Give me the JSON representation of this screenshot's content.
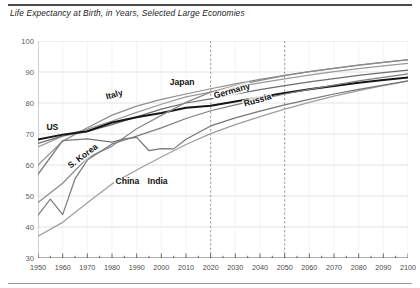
{
  "chart_data": {
    "type": "line",
    "title": "Life Expectancy at Birth, in Years, Selected Large Economies",
    "xlabel": "",
    "ylabel": "",
    "xlim": [
      1950,
      2100
    ],
    "ylim": [
      30,
      100
    ],
    "ytick_step": 10,
    "xtick_step": 10,
    "grid": true,
    "legend": "inline-labels",
    "xticks": [
      "1950",
      "1960",
      "1970",
      "1980",
      "1990",
      "2000",
      "2010",
      "2020",
      "2030",
      "2040",
      "2050",
      "2060",
      "2070",
      "2080",
      "2090",
      "2100"
    ],
    "yticks": [
      "30",
      "40",
      "50",
      "60",
      "70",
      "80",
      "90",
      "100"
    ],
    "annotations": [
      {
        "name": "projection-start-line",
        "type": "vline",
        "x": 2020,
        "style": "dashed"
      },
      {
        "name": "midcentury-line",
        "type": "vline",
        "x": 2050,
        "style": "dashed"
      }
    ],
    "series": [
      {
        "name": "Japan",
        "color": "#8e8e8e",
        "width": 1.25,
        "label_x": 2003,
        "label_y": 86.5,
        "label_rotation": 0,
        "x": [
          1950,
          1960,
          1970,
          1980,
          1990,
          2000,
          2010,
          2020,
          2030,
          2040,
          2050,
          2060,
          2070,
          2080,
          2090,
          2100
        ],
        "y": [
          60.0,
          67.7,
          72.0,
          76.1,
          79.0,
          81.2,
          82.9,
          84.6,
          86.2,
          87.6,
          88.9,
          90.1,
          91.2,
          92.2,
          93.1,
          94.0
        ]
      },
      {
        "name": "Italy",
        "color": "#9a9a9a",
        "width": 1.25,
        "label_x": 1977,
        "label_y": 81.5,
        "label_rotation": -16,
        "x": [
          1950,
          1960,
          1970,
          1980,
          1990,
          2000,
          2010,
          2020,
          2030,
          2040,
          2050,
          2060,
          2070,
          2080,
          2090,
          2100
        ],
        "y": [
          65.8,
          69.3,
          71.6,
          74.2,
          77.0,
          79.6,
          82.0,
          83.5,
          85.1,
          86.5,
          87.8,
          89.0,
          90.1,
          91.1,
          92.0,
          92.8
        ]
      },
      {
        "name": "Germany",
        "color": "#6d6d6d",
        "width": 1.25,
        "label_x": 2021,
        "label_y": 82.0,
        "label_rotation": -16,
        "x": [
          1950,
          1960,
          1970,
          1980,
          1990,
          2000,
          2010,
          2020,
          2030,
          2040,
          2050,
          2060,
          2070,
          2080,
          2090,
          2100
        ],
        "y": [
          67.0,
          69.4,
          70.8,
          73.0,
          75.5,
          78.0,
          80.0,
          81.3,
          82.9,
          84.3,
          85.6,
          86.8,
          87.9,
          88.9,
          89.8,
          90.6
        ]
      },
      {
        "name": "US",
        "color": "#151515",
        "width": 2.0,
        "label_x": 1953,
        "label_y": 72.0,
        "label_rotation": 0,
        "x": [
          1950,
          1960,
          1970,
          1980,
          1990,
          2000,
          2010,
          2020,
          2030,
          2040,
          2050,
          2060,
          2070,
          2080,
          2090,
          2100
        ],
        "y": [
          68.2,
          69.8,
          70.9,
          73.7,
          75.4,
          76.8,
          78.5,
          79.1,
          80.5,
          81.9,
          83.2,
          84.4,
          85.5,
          86.5,
          87.4,
          88.2
        ]
      },
      {
        "name": "S. Korea",
        "color": "#8a8a8a",
        "width": 1.25,
        "label_x": 1962,
        "label_y": 59.0,
        "label_rotation": -37,
        "x": [
          1950,
          1960,
          1970,
          1980,
          1990,
          2000,
          2010,
          2020,
          2030,
          2040,
          2050,
          2060,
          2070,
          2080,
          2090,
          2100
        ],
        "y": [
          47.9,
          54.1,
          62.3,
          66.1,
          71.7,
          76.0,
          80.2,
          83.5,
          85.6,
          87.3,
          88.8,
          90.1,
          91.2,
          92.2,
          93.1,
          93.9
        ]
      },
      {
        "name": "China",
        "color": "#7d7d7d",
        "width": 1.25,
        "label_x": 1981,
        "label_y": 54.5,
        "label_rotation": 0,
        "x": [
          1950,
          1955,
          1960,
          1965,
          1970,
          1980,
          1990,
          2000,
          2010,
          2020,
          2030,
          2040,
          2050,
          2060,
          2070,
          2080,
          2090,
          2100
        ],
        "y": [
          43.8,
          49.0,
          44.0,
          55.5,
          61.6,
          66.8,
          69.3,
          72.0,
          75.0,
          77.5,
          79.4,
          81.2,
          82.9,
          84.4,
          85.8,
          87.1,
          88.3,
          89.4
        ]
      },
      {
        "name": "India",
        "color": "#9e9e9e",
        "width": 1.25,
        "label_x": 1994,
        "label_y": 54.5,
        "label_rotation": 0,
        "x": [
          1950,
          1960,
          1970,
          1980,
          1990,
          2000,
          2010,
          2020,
          2030,
          2040,
          2050,
          2060,
          2070,
          2080,
          2090,
          2100
        ],
        "y": [
          37.0,
          41.5,
          47.8,
          53.9,
          58.4,
          62.6,
          66.6,
          70.1,
          73.0,
          75.6,
          78.0,
          80.2,
          82.2,
          84.0,
          85.6,
          87.1
        ]
      },
      {
        "name": "Russia",
        "color": "#777777",
        "width": 1.25,
        "label_x": 2033,
        "label_y": 79.5,
        "label_rotation": -16,
        "x": [
          1950,
          1960,
          1970,
          1980,
          1985,
          1990,
          1995,
          2000,
          2005,
          2010,
          2020,
          2030,
          2040,
          2050,
          2060,
          2070,
          2080,
          2090,
          2100
        ],
        "y": [
          57.0,
          67.9,
          68.4,
          67.4,
          68.4,
          68.9,
          64.6,
          65.3,
          65.2,
          68.3,
          72.6,
          75.2,
          77.4,
          79.4,
          81.2,
          82.9,
          84.4,
          85.8,
          87.1
        ]
      }
    ]
  }
}
